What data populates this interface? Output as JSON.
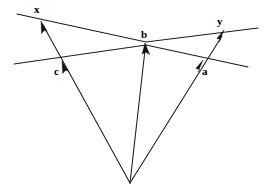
{
  "figure": {
    "type": "vector-geometry-diagram",
    "width": 268,
    "height": 193,
    "background_color": "#ffffff",
    "stroke_color": "#1a1a1a",
    "label_color": "#000000"
  },
  "labels": {
    "x": "x",
    "y": "y",
    "a": "a",
    "b": "b",
    "c": "c"
  },
  "label_positions": {
    "x": {
      "left": 34,
      "top": 4
    },
    "y": {
      "left": 217,
      "top": 16
    },
    "b": {
      "left": 141,
      "top": 29
    },
    "c": {
      "left": 54,
      "top": 66
    },
    "a": {
      "left": 202,
      "top": 66
    }
  },
  "geometry": {
    "apex": {
      "x": 130,
      "y": 183
    },
    "lines": [
      {
        "name": "upper-line",
        "from": {
          "x": 17,
          "y": 14
        },
        "to": {
          "x": 258,
          "y": 28
        },
        "via": {
          "x": 146,
          "y": 42
        }
      },
      {
        "name": "lower-line",
        "from": {
          "x": 14,
          "y": 64
        },
        "to": {
          "x": 248,
          "y": 67
        },
        "via": {
          "x": 146,
          "y": 45
        }
      }
    ],
    "rays": [
      {
        "name": "ray-to-x",
        "from": {
          "x": 130,
          "y": 183
        },
        "to": {
          "x": 41,
          "y": 21
        }
      },
      {
        "name": "ray-to-b",
        "from": {
          "x": 130,
          "y": 183
        },
        "to": {
          "x": 146,
          "y": 45
        }
      },
      {
        "name": "ray-to-y",
        "from": {
          "x": 130,
          "y": 183
        },
        "to": {
          "x": 224,
          "y": 32
        }
      }
    ],
    "arrow_tips": [
      {
        "name": "arrow-x",
        "x": 41,
        "y": 21
      },
      {
        "name": "arrow-c",
        "x": 62,
        "y": 64
      },
      {
        "name": "arrow-b",
        "x": 146,
        "y": 45
      },
      {
        "name": "arrow-a",
        "x": 203,
        "y": 63
      },
      {
        "name": "arrow-y",
        "x": 224,
        "y": 32
      }
    ]
  }
}
